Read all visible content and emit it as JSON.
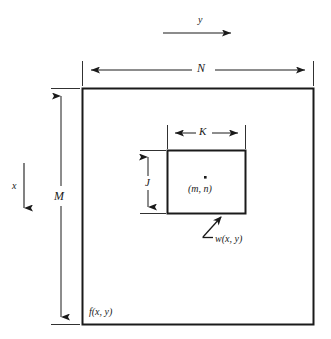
{
  "figure": {
    "background_color": "#ffffff",
    "line_color": "#1a1a1a",
    "labels": {
      "axis_y": "y",
      "axis_x": "x",
      "dim_n": "N",
      "dim_m": "M",
      "dim_k": "K",
      "dim_j": "J",
      "center_point": "(m, n)",
      "subimage": "w(x, y)",
      "image": "f(x, y)"
    },
    "geometry": {
      "outer_rect": {
        "x": 82,
        "y": 88,
        "width": 232,
        "height": 237
      },
      "inner_rect": {
        "x": 167,
        "y": 150,
        "width": 79,
        "height": 64
      },
      "center_dot": {
        "x": 205,
        "y": 177
      },
      "dim_n_line": {
        "y": 70,
        "x1": 82,
        "x2": 314
      },
      "dim_m_line": {
        "x": 61,
        "y1": 88,
        "y2": 325
      },
      "dim_k_line": {
        "y": 133,
        "x1": 167,
        "x2": 246
      },
      "dim_j_line": {
        "x": 148,
        "y1": 150,
        "y2": 214
      },
      "axis_y_arrow": {
        "y": 33,
        "x1": 163,
        "x2": 238
      },
      "axis_x_arrow": {
        "x": 24,
        "y1": 163,
        "y2": 215
      },
      "leader_line": {
        "x1": 202,
        "y1": 238,
        "x2": 222,
        "y2": 216
      }
    }
  }
}
